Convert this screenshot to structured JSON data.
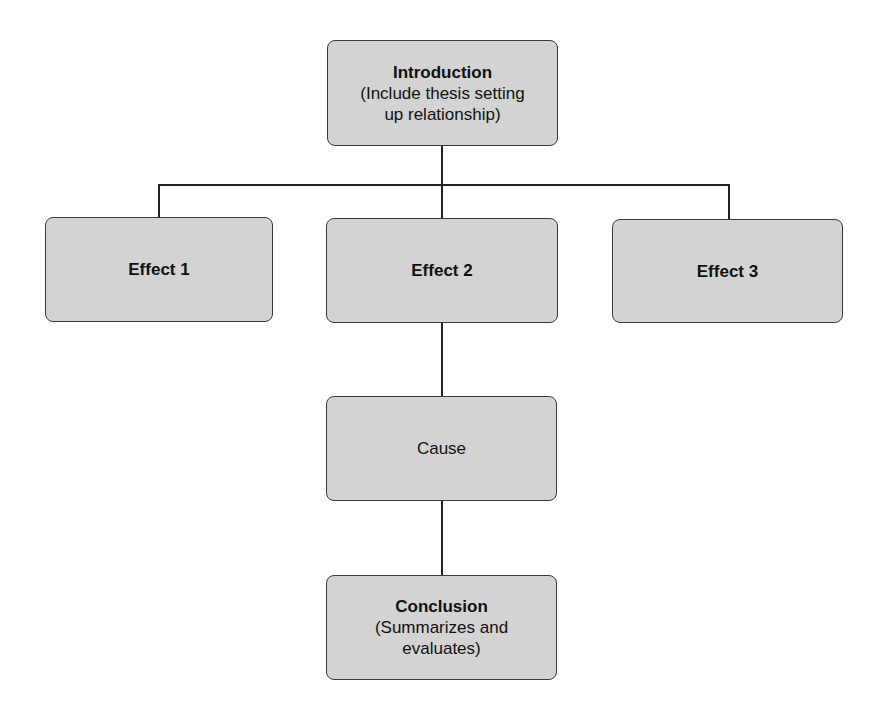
{
  "diagram": {
    "type": "flowchart",
    "colors": {
      "box_fill": "#d3d3d3",
      "box_border": "#3a3a3a",
      "line": "#222222"
    },
    "nodes": {
      "introduction": {
        "title": "Introduction",
        "subtitle_1": "(Include thesis setting",
        "subtitle_2": "up relationship)"
      },
      "effect1": {
        "title": "Effect 1"
      },
      "effect2": {
        "title": "Effect 2"
      },
      "effect3": {
        "title": "Effect 3"
      },
      "cause": {
        "title": "Cause"
      },
      "conclusion": {
        "title": "Conclusion",
        "subtitle_1": "(Summarizes and",
        "subtitle_2": "evaluates)"
      }
    },
    "edges": [
      [
        "introduction",
        "effect1"
      ],
      [
        "introduction",
        "effect2"
      ],
      [
        "introduction",
        "effect3"
      ],
      [
        "effect2",
        "cause"
      ],
      [
        "cause",
        "conclusion"
      ]
    ]
  }
}
